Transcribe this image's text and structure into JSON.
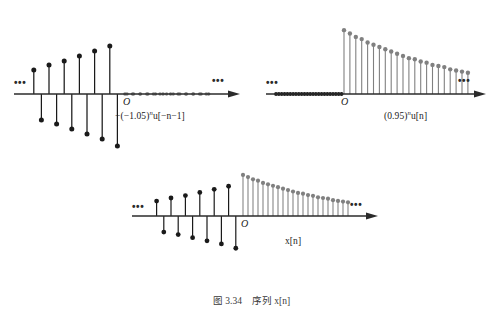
{
  "figure": {
    "caption_number": "图 3.34",
    "caption_text": "序列 x[n]",
    "caption_full": "图 3.34   序列 x[n]"
  },
  "colors": {
    "stem_black": "#1a1a1a",
    "stem_gray": "#808080",
    "axis": "#2b2b2b",
    "background": "#ffffff",
    "caption_text": "#3a3a3a"
  },
  "plots": [
    {
      "id": "plot-left",
      "name": "left-signal-plot",
      "label": "−(−1.05)ⁿu[−n−1]",
      "label_parts": {
        "prefix": "−(−1.05)",
        "exponent": "n",
        "suffix": "u[−n−1]"
      },
      "origin_label": "O",
      "left_ellipsis": "•••",
      "right_ellipsis": "•••",
      "has_arrow": true,
      "description": "Growing alternating-sign stems for n<0, zeros for n>=0",
      "stem_color": "#1a1a1a",
      "zero_dot_color": "#808080"
    },
    {
      "id": "plot-right",
      "name": "right-signal-plot",
      "label": "(0.95)ⁿu[n]",
      "label_parts": {
        "prefix": "(0.95)",
        "exponent": "n",
        "suffix": "u[n]"
      },
      "origin_label": "O",
      "left_ellipsis": "•••",
      "right_ellipsis": "•••",
      "has_arrow": true,
      "description": "Decaying positive stems for n>=0, zeros for n<0",
      "stem_color": "#808080",
      "zero_dot_color": "#1a1a1a"
    },
    {
      "id": "plot-bottom",
      "name": "sum-signal-plot",
      "label": "x[n]",
      "label_parts": {
        "prefix": "x[n]",
        "exponent": "",
        "suffix": ""
      },
      "origin_label": "O",
      "left_ellipsis": "•••",
      "right_ellipsis": "•••",
      "has_arrow": true,
      "description": "Sum of the two sequences",
      "stem_color_left": "#1a1a1a",
      "stem_color_right": "#808080"
    }
  ],
  "chart_data": {
    "type": "line",
    "title": "序列 x[n]",
    "xlabel": "n",
    "ylabel": "",
    "subplots": [
      {
        "name": "−(−1.05)ⁿu[−n−1]",
        "type": "stem",
        "x": [
          -12,
          -11,
          -10,
          -9,
          -8,
          -7,
          -6,
          -5,
          -4,
          -3,
          -2,
          -1,
          0,
          1,
          2,
          3,
          4,
          5,
          6,
          7,
          8,
          9,
          10,
          11,
          12
        ],
        "y": [
          24,
          -26,
          29,
          -30,
          33,
          -35,
          38,
          -40,
          43,
          -45,
          48,
          -52,
          0,
          0,
          0,
          0,
          0,
          0,
          0,
          0,
          0,
          0,
          0,
          0,
          0
        ],
        "note": "magnitude grows as 1.05^|n| toward n = -1; sign alternates; zero for n >= 0"
      },
      {
        "name": "(0.95)ⁿu[n]",
        "type": "stem",
        "x": [
          -12,
          -11,
          -10,
          -9,
          -8,
          -7,
          -6,
          -5,
          -4,
          -3,
          -2,
          -1,
          0,
          1,
          2,
          3,
          4,
          5,
          6,
          7,
          8,
          9,
          10,
          11,
          12,
          13,
          14,
          15,
          16,
          17,
          18,
          19,
          20,
          21
        ],
        "y": [
          0,
          0,
          0,
          0,
          0,
          0,
          0,
          0,
          0,
          0,
          0,
          0,
          57,
          54,
          51,
          49,
          46,
          44,
          42,
          40,
          38,
          36,
          34,
          32,
          31,
          29,
          28,
          26,
          25,
          24,
          22,
          21,
          20,
          19
        ],
        "note": "0.95^n for n >= 0; zero for n < 0"
      },
      {
        "name": "x[n]",
        "type": "stem",
        "x": [
          -12,
          -11,
          -10,
          -9,
          -8,
          -7,
          -6,
          -5,
          -4,
          -3,
          -2,
          -1,
          0,
          1,
          2,
          3,
          4,
          5,
          6,
          7,
          8,
          9,
          10,
          11,
          12,
          13,
          14,
          15,
          16,
          17,
          18,
          19,
          20,
          21
        ],
        "y": [
          24,
          -26,
          29,
          -30,
          33,
          -35,
          38,
          -40,
          43,
          -45,
          48,
          -52,
          57,
          54,
          51,
          49,
          46,
          44,
          42,
          40,
          38,
          36,
          34,
          32,
          31,
          29,
          28,
          26,
          25,
          24,
          22,
          21,
          20,
          19
        ],
        "note": "sum of the two sequences above"
      }
    ],
    "grid": false,
    "legend": "none"
  }
}
